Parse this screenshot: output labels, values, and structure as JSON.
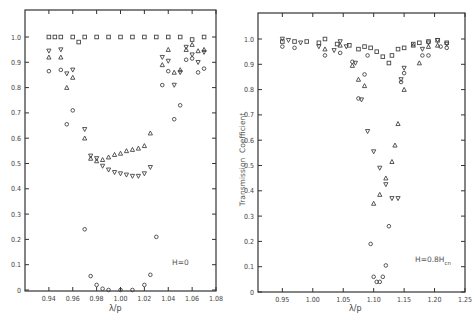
{
  "chart_data": [
    {
      "type": "scatter",
      "title": "",
      "annotation": "H=0",
      "xlabel": "λ/p",
      "ylabel": "",
      "xlim": [
        0.92,
        1.08
      ],
      "ylim": [
        0,
        1.1
      ],
      "xticks": [
        "0.94",
        "0.96",
        "0.98",
        "1.00",
        "1.02",
        "1.04",
        "1.06",
        "1.08"
      ],
      "yticks": [
        "0",
        "0.1",
        "0.2",
        "0.3",
        "0.4",
        "0.5",
        "0.6",
        "0.7",
        "0.8",
        "0.9",
        "1.0"
      ],
      "grid": false,
      "series": [
        {
          "name": "square",
          "marker": "square",
          "x": [
            0.94,
            0.945,
            0.95,
            0.96,
            0.965,
            0.97,
            0.98,
            0.99,
            1.0,
            1.01,
            1.02,
            1.03,
            1.04,
            1.05,
            1.06,
            1.07
          ],
          "y": [
            1.0,
            1.0,
            1.0,
            1.0,
            0.98,
            1.0,
            1.0,
            1.0,
            1.0,
            1.0,
            1.0,
            1.0,
            1.0,
            1.0,
            0.99,
            1.0
          ]
        },
        {
          "name": "down-triangle",
          "marker": "triangle-down",
          "x": [
            0.94,
            0.95,
            0.955,
            0.96,
            0.97,
            0.975,
            0.98,
            0.985,
            0.99,
            0.995,
            1.0,
            1.005,
            1.01,
            1.015,
            1.02,
            1.025,
            1.035,
            1.04,
            1.045,
            1.05,
            1.055,
            1.06,
            1.065,
            1.07
          ],
          "y": [
            0.945,
            0.95,
            0.855,
            0.87,
            0.635,
            0.53,
            0.52,
            0.49,
            0.475,
            0.465,
            0.46,
            0.455,
            0.45,
            0.45,
            0.46,
            0.485,
            0.92,
            0.905,
            0.81,
            0.86,
            0.96,
            0.93,
            0.9,
            0.94
          ]
        },
        {
          "name": "up-triangle",
          "marker": "triangle-up",
          "x": [
            0.94,
            0.95,
            0.955,
            0.96,
            0.97,
            0.975,
            0.98,
            0.985,
            0.99,
            0.995,
            1.0,
            1.005,
            1.01,
            1.015,
            1.02,
            1.025,
            1.035,
            1.04,
            1.045,
            1.05,
            1.055,
            1.06,
            1.065,
            1.07
          ],
          "y": [
            0.92,
            0.92,
            0.8,
            0.84,
            0.6,
            0.52,
            0.51,
            0.515,
            0.525,
            0.535,
            0.54,
            0.55,
            0.555,
            0.56,
            0.57,
            0.62,
            0.89,
            0.95,
            0.86,
            0.87,
            0.95,
            0.97,
            0.945,
            0.95
          ]
        },
        {
          "name": "circle",
          "marker": "circle",
          "x": [
            0.94,
            0.95,
            0.955,
            0.96,
            0.97,
            0.975,
            0.98,
            0.985,
            0.99,
            1.0,
            1.01,
            1.02,
            1.025,
            1.03,
            1.035,
            1.04,
            1.045,
            1.05,
            1.055,
            1.06,
            1.065,
            1.07
          ],
          "y": [
            0.865,
            0.87,
            0.655,
            0.71,
            0.24,
            0.055,
            0.02,
            0.005,
            0.0,
            0.0,
            0.0,
            0.02,
            0.06,
            0.21,
            0.81,
            0.865,
            0.675,
            0.73,
            0.91,
            0.915,
            0.86,
            0.875
          ]
        }
      ]
    },
    {
      "type": "scatter",
      "title": "",
      "annotation": "H=0.8H_cn",
      "annotation_main": "H=0.8H",
      "annotation_sub": "cn",
      "xlabel": "λ/p",
      "ylabel": "Transmission  Coefficient",
      "xlim": [
        0.91,
        1.25
      ],
      "ylim": [
        0,
        1.1
      ],
      "xticks": [
        "0.95",
        "1.00",
        "1.05",
        "1.10",
        "1.15",
        "1.20",
        "1.25"
      ],
      "yticks": [
        "0",
        "0.1",
        "0.2",
        "0.3",
        "0.4",
        "0.5",
        "0.6",
        "0.7",
        "0.8",
        "0.9",
        "1.0"
      ],
      "grid": false,
      "series": [
        {
          "name": "square",
          "marker": "square",
          "x": [
            0.95,
            0.97,
            0.99,
            1.01,
            1.02,
            1.04,
            1.06,
            1.075,
            1.085,
            1.095,
            1.105,
            1.115,
            1.125,
            1.13,
            1.14,
            1.15,
            1.165,
            1.175,
            1.19,
            1.205,
            1.22
          ],
          "y": [
            0.99,
            0.99,
            0.99,
            0.985,
            1.0,
            0.98,
            0.975,
            0.96,
            0.97,
            0.965,
            0.95,
            0.93,
            0.905,
            0.935,
            0.96,
            0.965,
            0.98,
            0.985,
            0.99,
            0.995,
            0.985
          ]
        },
        {
          "name": "down-triangle",
          "marker": "triangle-down",
          "x": [
            0.95,
            0.96,
            0.98,
            1.01,
            1.035,
            1.045,
            1.055,
            1.07,
            1.08,
            1.09,
            1.1,
            1.11,
            1.12,
            1.13,
            1.14,
            1.145,
            1.15,
            1.18,
            1.19,
            1.205,
            1.22
          ],
          "y": [
            1.0,
            0.995,
            0.985,
            0.97,
            0.955,
            0.99,
            0.97,
            0.905,
            0.76,
            0.635,
            0.555,
            0.49,
            0.425,
            0.37,
            0.37,
            0.84,
            0.885,
            0.96,
            0.985,
            0.995,
            0.98
          ]
        },
        {
          "name": "up-triangle",
          "marker": "triangle-up",
          "x": [
            1.02,
            1.045,
            1.065,
            1.075,
            1.085,
            1.1,
            1.11,
            1.12,
            1.13,
            1.135,
            1.14,
            1.15,
            1.165,
            1.175,
            1.19,
            1.205
          ],
          "y": [
            0.96,
            0.975,
            0.895,
            0.84,
            0.815,
            0.35,
            0.385,
            0.45,
            0.515,
            0.58,
            0.665,
            0.8,
            0.975,
            0.905,
            0.97,
            0.975
          ]
        },
        {
          "name": "circle",
          "marker": "circle",
          "x": [
            0.95,
            0.97,
            1.02,
            1.045,
            1.065,
            1.075,
            1.085,
            1.09,
            1.095,
            1.1,
            1.105,
            1.11,
            1.115,
            1.12,
            1.125,
            1.145,
            1.15,
            1.18,
            1.19,
            1.21,
            1.22
          ],
          "y": [
            0.97,
            0.965,
            0.935,
            0.945,
            0.91,
            0.765,
            0.86,
            0.935,
            0.19,
            0.06,
            0.04,
            0.04,
            0.06,
            0.105,
            0.26,
            0.83,
            0.865,
            0.935,
            0.935,
            0.97,
            0.965
          ]
        }
      ]
    }
  ]
}
